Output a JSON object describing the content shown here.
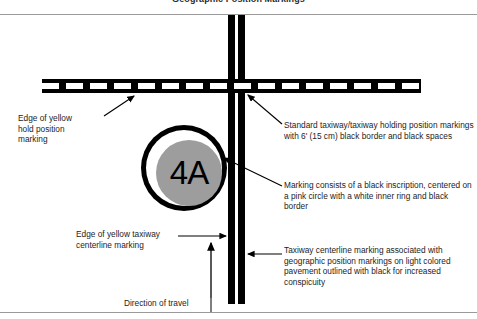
{
  "figure": {
    "title": "Geographic Position Markings"
  },
  "marking": {
    "inscription": "4A",
    "colors": {
      "outer_border": "#000000",
      "inner_ring": "#ffffff",
      "circle_fill": "#9d9d9d",
      "inscription_color": "#000000"
    }
  },
  "callouts": {
    "hold_edge": "Edge of yellow\nhold position\nmarking",
    "centerline_edge": "Edge of yellow taxiway\ncenterline marking",
    "direction_of_travel": "Direction of travel",
    "standard_holding": "Standard taxiway/taxiway holding position markings with 6' (15 cm) black border and black spaces",
    "marking_description": "Marking consists of a black inscription, centered on a pink circle with a white inner ring and black border",
    "taxiway_centerline": "Taxiway centerline marking associated with geographic position markings on light colored pavement outlined with black for increased conspicuity"
  }
}
